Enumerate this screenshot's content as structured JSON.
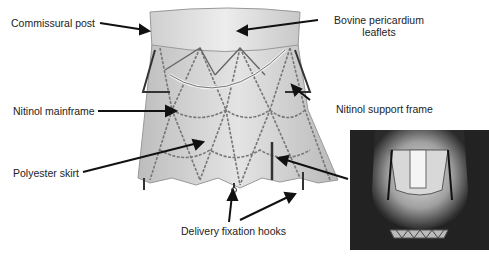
{
  "figure": {
    "labels": [
      {
        "id": "commissural-post",
        "text": "Commissural post"
      },
      {
        "id": "bovine-pericardium",
        "line1": "Bovine pericardium",
        "line2": "leaflets"
      },
      {
        "id": "nitinol-mainframe",
        "text": "Nitinol mainframe"
      },
      {
        "id": "nitinol-support-frame",
        "text": "Nitinol support frame"
      },
      {
        "id": "polyester-skirt",
        "text": "Polyester skirt"
      },
      {
        "id": "delivery-fixation-hooks",
        "text": "Delivery fixation hooks"
      }
    ],
    "inset": {
      "description": "Photograph of valve deployed in situ"
    }
  }
}
